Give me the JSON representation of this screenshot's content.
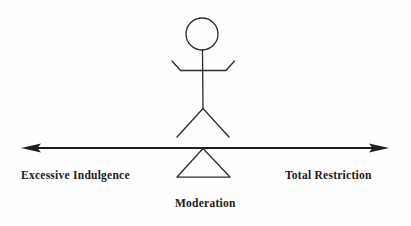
{
  "diagram": {
    "type": "hand-drawn-concept-diagram",
    "background_color": "#fefeff",
    "stroke_color": "#2b2b2b",
    "text_color": "#1a1a1a",
    "axis": {
      "label_left": "Excessive Indulgence",
      "label_right": "Total Restriction",
      "label_center": "Moderation",
      "arrow_style": "double-headed",
      "line_y": 148,
      "line_x_start": 22,
      "line_x_end": 388
    },
    "figure": {
      "name": "stick-figure",
      "head_center_x": 202,
      "head_center_y": 34,
      "head_radius": 16,
      "torso_top_y": 50,
      "torso_bottom_y": 108,
      "arm_span_left_x": 172,
      "arm_span_right_x": 234,
      "leg_left_x": 177,
      "leg_right_x": 229,
      "leg_bottom_y": 137
    },
    "fulcrum": {
      "name": "triangle-pivot",
      "apex_x": 203,
      "apex_y": 148,
      "base_left_x": 177,
      "base_right_x": 230,
      "base_y": 177
    }
  }
}
